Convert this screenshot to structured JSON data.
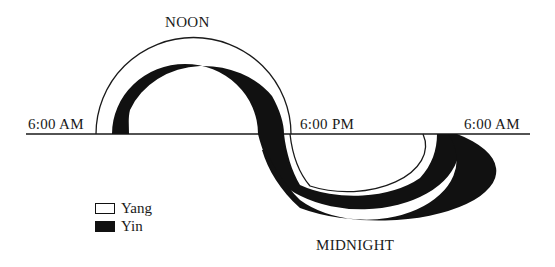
{
  "diagram": {
    "type": "yin-yang daily cycle",
    "labels": {
      "noon": "NOON",
      "midnight": "MIDNIGHT",
      "left_6am": "6:00 AM",
      "evening_6pm": "6:00 PM",
      "right_6am": "6:00 AM"
    },
    "legend": [
      {
        "label": "Yang",
        "color": "#ffffff"
      },
      {
        "label": "Yin",
        "color": "#111111"
      }
    ],
    "colors": {
      "yang": "#ffffff",
      "yin": "#111111",
      "line": "#1a1a1a"
    }
  }
}
